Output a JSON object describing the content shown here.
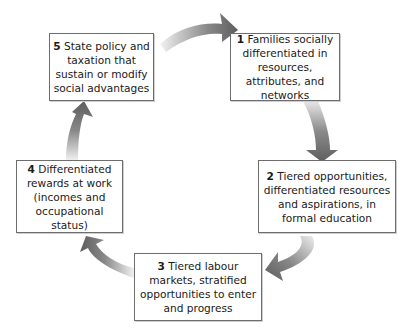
{
  "diagram": {
    "type": "cycle",
    "arrow_color": "#6e6e6e",
    "steps": [
      {
        "number": "1",
        "text": "Families socially differentiated in resources, attributes, and networks"
      },
      {
        "number": "2",
        "text": "Tiered opportunities, differentiated resources and aspirations, in formal education"
      },
      {
        "number": "3",
        "text": "Tiered labour markets, stratified opportunities to enter and progress"
      },
      {
        "number": "4",
        "text": "Differentiated rewards at work (incomes and occupational status)"
      },
      {
        "number": "5",
        "text": "State policy and taxation that sustain or modify social advantages"
      }
    ],
    "flow": [
      "5→1",
      "1→2",
      "2→3",
      "3→4",
      "4→5"
    ]
  }
}
